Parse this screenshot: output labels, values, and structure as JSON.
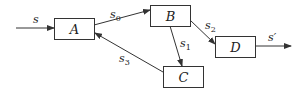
{
  "diagram": {
    "type": "block-diagram",
    "nodes": [
      {
        "id": "A",
        "label": "A"
      },
      {
        "id": "B",
        "label": "B"
      },
      {
        "id": "C",
        "label": "C"
      },
      {
        "id": "D",
        "label": "D"
      }
    ],
    "edges": [
      {
        "id": "in",
        "from": null,
        "to": "A",
        "label": "s"
      },
      {
        "id": "s0",
        "from": "A",
        "to": "B",
        "label": "s",
        "sub": "0"
      },
      {
        "id": "s1",
        "from": "B",
        "to": "C",
        "label": "s",
        "sub": "1"
      },
      {
        "id": "s2",
        "from": "B",
        "to": "D",
        "label": "s",
        "sub": "2"
      },
      {
        "id": "s3",
        "from": "C",
        "to": "A",
        "label": "s",
        "sub": "3"
      },
      {
        "id": "out",
        "from": "D",
        "to": null,
        "label": "s′"
      }
    ]
  }
}
